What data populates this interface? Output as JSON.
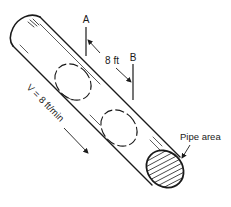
{
  "diagram": {
    "labels": {
      "section_a": "A",
      "section_b": "B",
      "distance": "8 ft",
      "velocity": "V = 8 ft/min",
      "pipe_area": "Pipe area"
    },
    "colors": {
      "stroke": "#1a1a1a",
      "background": "#ffffff"
    }
  }
}
